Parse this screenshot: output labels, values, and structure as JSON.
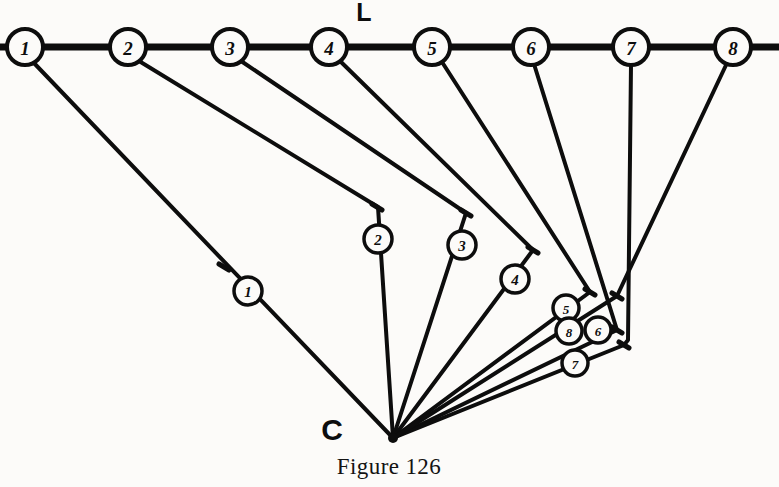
{
  "figure": {
    "caption": "Figure 126",
    "line_label": "L",
    "center_label": "C",
    "background_color": "#fcfbf9",
    "ink_color": "#0d0d0d"
  },
  "baseline": {
    "name": "L",
    "y": 47,
    "x_start": 0,
    "x_end": 779,
    "stroke_width": 7,
    "nodes": [
      {
        "label": "1",
        "cx": 25,
        "cy": 47,
        "r": 18
      },
      {
        "label": "2",
        "cx": 128,
        "cy": 47,
        "r": 18
      },
      {
        "label": "3",
        "cx": 230,
        "cy": 47,
        "r": 18
      },
      {
        "label": "4",
        "cx": 329,
        "cy": 47,
        "r": 18
      },
      {
        "label": "5",
        "cx": 432,
        "cy": 47,
        "r": 18
      },
      {
        "label": "6",
        "cx": 531,
        "cy": 47,
        "r": 18
      },
      {
        "label": "7",
        "cx": 631,
        "cy": 47,
        "r": 18
      },
      {
        "label": "8",
        "cx": 733,
        "cy": 47,
        "r": 18
      }
    ]
  },
  "center": {
    "label": "C",
    "x": 393,
    "y": 438,
    "label_x": 332,
    "label_y": 440
  },
  "line_label_pos": {
    "x": 364,
    "y": 21
  },
  "caption_pos": {
    "x": 389,
    "y": 474
  },
  "rays": [
    {
      "name": "ray-1",
      "from_node": "1",
      "marker_label": "1",
      "marker": {
        "cx": 248,
        "cy": 291,
        "r": 14
      },
      "tick": {
        "x": 224,
        "y": 267
      },
      "path": "M 33 62 L 393 438",
      "stroke_width": 4
    },
    {
      "name": "ray-2",
      "from_node": "2",
      "marker_label": "2",
      "marker": {
        "cx": 378,
        "cy": 239,
        "r": 14
      },
      "tick": {
        "x": 377,
        "y": 207
      },
      "path": "M 139 61 L 378 207 L 393 438",
      "stroke_width": 4
    },
    {
      "name": "ray-3",
      "from_node": "3",
      "marker_label": "3",
      "marker": {
        "cx": 462,
        "cy": 245,
        "r": 14
      },
      "tick": {
        "x": 466,
        "y": 213
      },
      "path": "M 241 61 L 466 213 L 393 438",
      "stroke_width": 4
    },
    {
      "name": "ray-4",
      "from_node": "4",
      "marker_label": "4",
      "marker": {
        "cx": 515,
        "cy": 279,
        "r": 14
      },
      "tick": {
        "x": 533,
        "y": 250
      },
      "path": "M 340 61 L 533 250 L 393 438",
      "stroke_width": 4
    },
    {
      "name": "ray-5",
      "from_node": "5",
      "marker_label": "5",
      "marker": {
        "cx": 566,
        "cy": 308,
        "r": 13
      },
      "tick": {
        "x": 590,
        "y": 292
      },
      "path": "M 442 62 L 590 292 L 393 438",
      "stroke_width": 4
    },
    {
      "name": "ray-6",
      "from_node": "6",
      "marker_label": "6",
      "marker": {
        "cx": 598,
        "cy": 330,
        "r": 13
      },
      "tick": {
        "x": 617,
        "y": 330
      },
      "path": "M 534 64 L 617 330 L 393 438",
      "stroke_width": 4
    },
    {
      "name": "ray-7",
      "from_node": "7",
      "marker_label": "7",
      "marker": {
        "cx": 575,
        "cy": 363,
        "r": 13
      },
      "tick": {
        "x": 624,
        "y": 345
      },
      "path": "M 631 65 L 628 340 L 624 345 L 393 438",
      "stroke_width": 4
    },
    {
      "name": "ray-8",
      "from_node": "8",
      "marker_label": "8",
      "marker": {
        "cx": 569,
        "cy": 331,
        "r": 13
      },
      "tick": {
        "x": 617,
        "y": 296
      },
      "path": "M 727 63 L 617 296 L 393 438",
      "stroke_width": 4
    }
  ],
  "chart_data": {
    "type": "diagram",
    "title": "Figure 126",
    "baseline_label": "L",
    "center_label": "C",
    "node_labels": [
      "1",
      "2",
      "3",
      "4",
      "5",
      "6",
      "7",
      "8"
    ],
    "marker_labels": [
      "1",
      "2",
      "3",
      "4",
      "5",
      "6",
      "7",
      "8"
    ],
    "node_x": [
      25,
      128,
      230,
      329,
      432,
      531,
      631,
      733
    ],
    "node_y": 47,
    "center_point": [
      393,
      438
    ],
    "bend_points": [
      [
        224,
        267
      ],
      [
        377,
        207
      ],
      [
        466,
        213
      ],
      [
        533,
        250
      ],
      [
        590,
        292
      ],
      [
        617,
        330
      ],
      [
        628,
        340
      ],
      [
        617,
        296
      ]
    ],
    "marker_points": [
      [
        248,
        291
      ],
      [
        378,
        239
      ],
      [
        462,
        245
      ],
      [
        515,
        279
      ],
      [
        566,
        308
      ],
      [
        598,
        330
      ],
      [
        575,
        363
      ],
      [
        569,
        331
      ]
    ],
    "xlabel": "",
    "ylabel": "",
    "grid": false,
    "legend": "none"
  }
}
